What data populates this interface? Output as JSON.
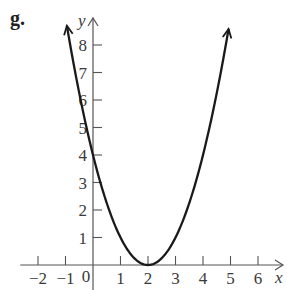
{
  "panel_label": "g.",
  "chart_data": {
    "type": "line",
    "title": "",
    "xlabel": "x",
    "ylabel": "y",
    "function": "y = (x - 2)^2",
    "xlim": [
      -2.5,
      6.8
    ],
    "ylim": [
      -0.6,
      8.9
    ],
    "x_ticks": [
      -2,
      -1,
      1,
      2,
      3,
      4,
      5,
      6
    ],
    "x_tick_labels": [
      "−2",
      "−1",
      "1",
      "2",
      "3",
      "4",
      "5",
      "6"
    ],
    "y_ticks": [
      1,
      2,
      3,
      4,
      5,
      6,
      7,
      8
    ],
    "y_tick_labels": [
      "1",
      "2",
      "3",
      "4",
      "5",
      "6",
      "7",
      "8"
    ],
    "origin_label": "0",
    "grid": false,
    "series": [
      {
        "name": "parabola",
        "x_range": [
          -0.95,
          4.93
        ],
        "points": [
          [
            -0.95,
            8.7
          ],
          [
            0,
            4
          ],
          [
            1,
            1
          ],
          [
            2,
            0
          ],
          [
            3,
            1
          ],
          [
            4,
            4
          ],
          [
            4.93,
            8.6
          ]
        ],
        "arrows_at_ends": true,
        "color": "#1a1a1a"
      }
    ],
    "key_points": {
      "y_intercept": [
        0,
        4
      ],
      "vertex": [
        2,
        0
      ]
    }
  }
}
